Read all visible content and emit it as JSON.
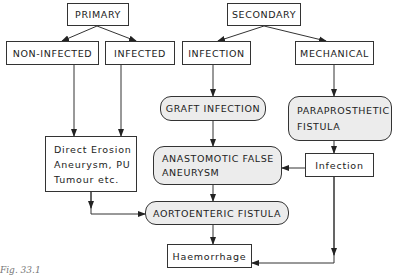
{
  "diagram": {
    "type": "flowchart",
    "nodes": {
      "primary": {
        "label": "PRIMARY"
      },
      "non_infected": {
        "label": "NON-INFECTED"
      },
      "infected": {
        "label": "INFECTED"
      },
      "secondary": {
        "label": "SECONDARY"
      },
      "infection_top": {
        "label": "INFECTION"
      },
      "mechanical": {
        "label": "MECHANICAL"
      },
      "graft_infection": {
        "label": "GRAFT INFECTION"
      },
      "paraprosthetic_fistula": {
        "label": "PARAPROSTHETIC\nFISTULA"
      },
      "direct_erosion": {
        "label": "Direct Erosion\nAneurysm, PU\nTumour etc."
      },
      "anastomotic_false_aneurysm": {
        "label": "ANASTOMOTIC FALSE\nANEURYSM"
      },
      "infection_lower": {
        "label": "Infection"
      },
      "aortoenteric_fistula": {
        "label": "AORTOENTERIC FISTULA"
      },
      "haemorrhage": {
        "label": "Haemorrhage"
      }
    },
    "edges": [
      [
        "PRIMARY",
        "NON-INFECTED"
      ],
      [
        "PRIMARY",
        "INFECTED"
      ],
      [
        "SECONDARY",
        "INFECTION"
      ],
      [
        "SECONDARY",
        "MECHANICAL"
      ],
      [
        "NON-INFECTED",
        "Direct Erosion Aneurysm, PU Tumour etc."
      ],
      [
        "INFECTED",
        "Direct Erosion Aneurysm, PU Tumour etc."
      ],
      [
        "INFECTION",
        "GRAFT INFECTION"
      ],
      [
        "MECHANICAL",
        "PARAPROSTHETIC FISTULA"
      ],
      [
        "GRAFT INFECTION",
        "ANASTOMOTIC FALSE ANEURYSM"
      ],
      [
        "PARAPROSTHETIC FISTULA",
        "Infection"
      ],
      [
        "Infection",
        "ANASTOMOTIC FALSE ANEURYSM"
      ],
      [
        "Direct Erosion Aneurysm, PU Tumour etc.",
        "AORTOENTERIC FISTULA"
      ],
      [
        "ANASTOMOTIC FALSE ANEURYSM",
        "AORTOENTERIC FISTULA"
      ],
      [
        "AORTOENTERIC FISTULA",
        "Haemorrhage"
      ],
      [
        "Infection",
        "Haemorrhage"
      ]
    ],
    "caption": "Fig. 33.1"
  }
}
